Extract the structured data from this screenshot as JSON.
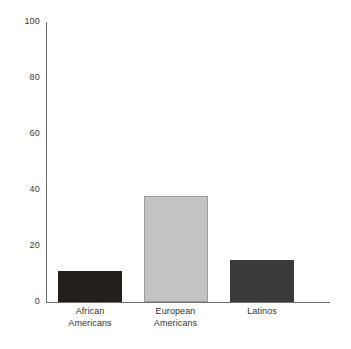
{
  "chart_data": {
    "type": "bar",
    "title": "",
    "subtitle": "",
    "xlabel": "",
    "ylabel": "",
    "categories": [
      "African\nAmericans",
      "European\nAmericans",
      "Latinos"
    ],
    "values": [
      11,
      38,
      15
    ],
    "ylim": [
      0,
      100
    ],
    "yticks": [
      "0",
      "20",
      "40",
      "60",
      "80",
      "100"
    ],
    "ytick_values": [
      0,
      20,
      40,
      60,
      80,
      100
    ],
    "grid": false,
    "legend": null,
    "bar_colors": [
      "#231f1c",
      "#c3c3c3",
      "#3a3a38"
    ],
    "bar_border_colors": [
      "#231f1c",
      "#9c9c9c",
      "#3a3a38"
    ],
    "background_color": "#ffffff",
    "axis_color": "#6f6f6f",
    "text_color": "#333333"
  },
  "bars": [
    {
      "label": "African\nAmericans",
      "value": 11
    },
    {
      "label": "European\nAmericans",
      "value": 38
    },
    {
      "label": "Latinos",
      "value": 15
    }
  ],
  "yticks": [
    {
      "label": "100",
      "value": 100
    },
    {
      "label": "80",
      "value": 80
    },
    {
      "label": "60",
      "value": 60
    },
    {
      "label": "40",
      "value": 40
    },
    {
      "label": "20",
      "value": 20
    },
    {
      "label": "0",
      "value": 0
    }
  ]
}
